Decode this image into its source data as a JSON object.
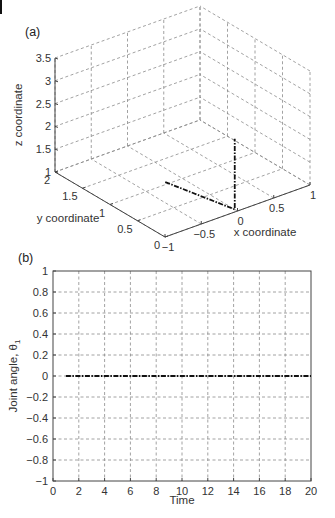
{
  "chart_data": [
    {
      "panel_label": "(a)",
      "type": "line3d",
      "xlabel": "x coordinate",
      "ylabel": "y coordinate",
      "zlabel": "z coordinate",
      "xlim": [
        -1,
        1
      ],
      "ylim": [
        0,
        2
      ],
      "zlim": [
        1,
        3.5
      ],
      "xticks": [
        "-1",
        "-0.5",
        "0",
        "0.5",
        "1"
      ],
      "yticks": [
        "0",
        "0.5",
        "1",
        "1.5",
        "2"
      ],
      "zticks": [
        "1",
        "1.5",
        "2",
        "2.5",
        "3",
        "3.5"
      ],
      "grid": true,
      "series": [
        {
          "name": "end-effector path",
          "style": "dash-dot",
          "points": [
            {
              "x": -0.2,
              "y": 1.05,
              "z": 1.0
            },
            {
              "x": 0.0,
              "y": 0.05,
              "z": 1.0
            },
            {
              "x": 0.0,
              "y": 0.05,
              "z": 1.35
            },
            {
              "x": 0.0,
              "y": 0.05,
              "z": 2.55
            }
          ]
        }
      ]
    },
    {
      "panel_label": "(b)",
      "type": "line",
      "xlabel": "Time",
      "ylabel": "Joint angle, θ",
      "ylabel_subscript": "1",
      "xlim": [
        0,
        20
      ],
      "ylim": [
        -1,
        1
      ],
      "xticks": [
        "0",
        "2",
        "4",
        "6",
        "8",
        "10",
        "12",
        "14",
        "16",
        "18",
        "20"
      ],
      "yticks": [
        "-1",
        "-0.8",
        "-0.6",
        "-0.4",
        "-0.2",
        "0",
        "0.2",
        "0.4",
        "0.6",
        "0.8",
        "1"
      ],
      "grid": true,
      "series": [
        {
          "name": "theta_1",
          "style": "dash-dot",
          "x": [
            1,
            2,
            4,
            6,
            8,
            10,
            12,
            14,
            16,
            18,
            20
          ],
          "y": [
            0,
            0,
            0,
            0,
            0,
            0,
            0,
            0,
            0,
            0,
            0
          ]
        }
      ]
    }
  ]
}
